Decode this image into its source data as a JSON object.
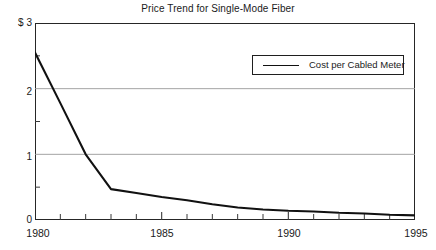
{
  "chart_data": {
    "type": "line",
    "title": "Price Trend for Single-Mode Fiber",
    "xlabel": "",
    "ylabel": "",
    "ylim": [
      0,
      3
    ],
    "xlim": [
      1980,
      1995
    ],
    "grid": "horizontal gridlines at y = 1 and y = 2",
    "legend_position": "inside plot, upper right",
    "y_axis_prefix": "$",
    "y_tick_labels": [
      "$ 3",
      "2",
      "1",
      "0"
    ],
    "y_tick_values": [
      3,
      2,
      1,
      0
    ],
    "y_minor_tick_values": [
      2.5,
      1.5,
      0.5
    ],
    "x_tick_labels": [
      "1980",
      "1985",
      "1990",
      "1995"
    ],
    "x_tick_values": [
      1980,
      1985,
      1990,
      1995
    ],
    "x_minor_tick_values": [
      1981,
      1982,
      1983,
      1984,
      1986,
      1987,
      1988,
      1989,
      1991,
      1992,
      1993,
      1994
    ],
    "x": [
      1980,
      1981,
      1982,
      1983,
      1984,
      1985,
      1986,
      1987,
      1988,
      1989,
      1990,
      1991,
      1992,
      1993,
      1994,
      1995
    ],
    "series": [
      {
        "name": "Cost per Cabled Meter",
        "color": "#111111",
        "values": [
          2.55,
          1.78,
          1.0,
          0.47,
          0.41,
          0.35,
          0.3,
          0.24,
          0.19,
          0.16,
          0.14,
          0.13,
          0.11,
          0.1,
          0.08,
          0.07
        ]
      }
    ]
  },
  "legend": {
    "entry_label": "Cost per Cabled Meter",
    "swatch_icon": "line-swatch-icon"
  },
  "axes": {
    "y_label_3": "$ 3",
    "y_label_2": "2",
    "y_label_1": "1",
    "y_label_0": "0",
    "x_label_1980": "1980",
    "x_label_1985": "1985",
    "x_label_1990": "1990",
    "x_label_1995": "1995"
  }
}
